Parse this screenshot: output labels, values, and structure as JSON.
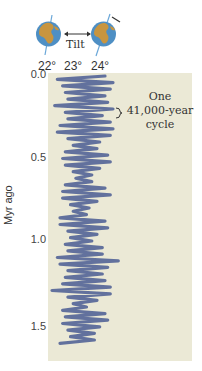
{
  "header": {
    "tilt_label": "Tilt",
    "globe_left_icon": "earth-globe-icon",
    "globe_right_icon": "earth-globe-icon",
    "arrow_icon": "double-arrow-icon"
  },
  "annotation": {
    "line1": "One",
    "line2": "41,000-year",
    "line3": "cycle"
  },
  "colors": {
    "panel_bg": "#ebe9d6",
    "curve": "#5b6a9a",
    "ocean": "#4e8fc4",
    "land": "#c8953f"
  },
  "chart_data": {
    "type": "line",
    "title": "",
    "xlabel": "Tilt (degrees)",
    "ylabel": "Myr ago",
    "x_ticks": [
      "22°",
      "23°",
      "24°"
    ],
    "y_ticks": [
      "0.0",
      "0.5",
      "1.0",
      "1.5"
    ],
    "xlim": [
      21.9,
      24.6
    ],
    "ylim": [
      0.0,
      1.75
    ],
    "orientation": "vertical-time-axis",
    "cycle_period_kyr": 41,
    "annotation": "One 41,000-year cycle",
    "series": [
      {
        "name": "Obliquity",
        "time_myr": [
          0.0,
          0.02,
          0.04,
          0.06,
          0.08,
          0.1,
          0.12,
          0.14,
          0.16,
          0.18,
          0.2,
          0.22,
          0.24,
          0.26,
          0.28,
          0.3,
          0.32,
          0.34,
          0.36,
          0.38,
          0.4,
          0.42,
          0.44,
          0.46,
          0.48,
          0.5,
          0.52,
          0.54,
          0.56,
          0.58,
          0.6,
          0.62,
          0.64,
          0.66,
          0.68,
          0.7,
          0.72,
          0.74,
          0.76,
          0.78,
          0.8,
          0.82,
          0.84,
          0.86,
          0.88,
          0.9,
          0.92,
          0.94,
          0.96,
          0.98,
          1.0,
          1.02,
          1.04,
          1.06,
          1.08,
          1.1,
          1.12,
          1.14,
          1.16,
          1.18,
          1.2,
          1.22,
          1.24,
          1.26,
          1.28,
          1.3,
          1.32,
          1.34,
          1.36,
          1.38,
          1.4,
          1.42,
          1.44,
          1.46,
          1.48,
          1.5,
          1.52,
          1.54,
          1.56,
          1.58,
          1.6,
          1.62
        ],
        "tilt_deg": [
          24.0,
          22.2,
          24.3,
          22.4,
          24.2,
          22.5,
          24.0,
          22.6,
          24.1,
          22.1,
          24.3,
          22.5,
          23.9,
          22.6,
          24.2,
          22.3,
          24.3,
          22.2,
          24.2,
          22.6,
          23.8,
          22.8,
          23.7,
          22.5,
          24.1,
          22.4,
          24.2,
          22.5,
          23.8,
          22.8,
          23.5,
          22.9,
          23.5,
          22.5,
          24.0,
          22.4,
          24.2,
          22.4,
          23.7,
          22.7,
          23.4,
          22.8,
          23.3,
          22.3,
          24.0,
          22.3,
          24.1,
          22.6,
          23.7,
          22.7,
          23.5,
          22.5,
          23.9,
          22.6,
          23.9,
          22.2,
          24.5,
          22.3,
          24.1,
          22.6,
          23.9,
          22.5,
          24.0,
          22.4,
          24.2,
          22.0,
          24.2,
          22.6,
          23.7,
          22.8,
          23.3,
          22.4,
          24.0,
          22.5,
          24.1,
          22.4,
          23.8,
          22.6,
          23.6,
          22.7,
          23.6,
          22.3
        ]
      }
    ],
    "grid": false,
    "legend": "none"
  }
}
